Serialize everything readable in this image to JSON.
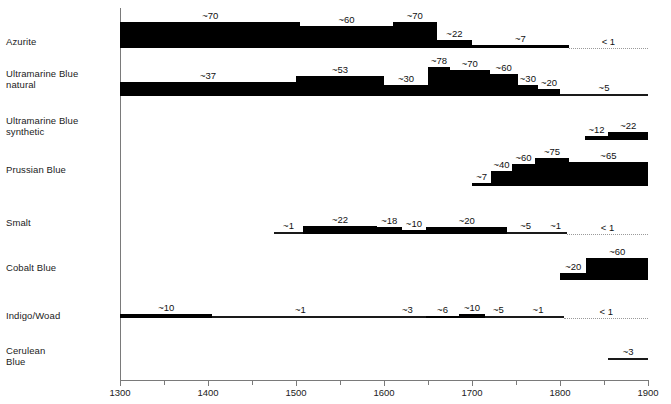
{
  "chart_data": {
    "type": "bar",
    "title": "",
    "xlabel": "",
    "ylabel": "",
    "xlim": [
      1300,
      1900
    ],
    "x_ticks": [
      1300,
      1350,
      1400,
      1450,
      1500,
      1550,
      1600,
      1650,
      1700,
      1750,
      1800,
      1850,
      1900
    ],
    "x_tick_labels": [
      "1300",
      "",
      "1400",
      "",
      "1500",
      "",
      "1600",
      "",
      "1700",
      "",
      "1800",
      "",
      "1900"
    ],
    "grid": false,
    "legend": "none",
    "value_prefix": "~",
    "note": "Horizontal timeline chart: relative usage/frequency of blue pigments over time. Each pigment row is a stepped band whose thickness encodes the value printed above each step.",
    "categories": [
      "Azurite",
      "Ultramarine Blue natural",
      "Ultramarine Blue synthetic",
      "Prussian Blue",
      "Smalt",
      "Cobalt Blue",
      "Indigo/Woad",
      "Cerulean Blue"
    ],
    "series": [
      {
        "name": "Azurite",
        "label_lines": [
          "Azurite"
        ],
        "segments": [
          {
            "start": 1300,
            "end": 1505,
            "value": 70,
            "label": "~70"
          },
          {
            "start": 1505,
            "end": 1610,
            "value": 60,
            "label": "~60"
          },
          {
            "start": 1610,
            "end": 1660,
            "value": 70,
            "label": "~70"
          },
          {
            "start": 1660,
            "end": 1700,
            "value": 22,
            "label": "~22"
          },
          {
            "start": 1700,
            "end": 1810,
            "value": 7,
            "label": "~7"
          },
          {
            "start": 1810,
            "end": 1900,
            "value": 0.5,
            "label": "< 1",
            "style": "dotted"
          }
        ]
      },
      {
        "name": "Ultramarine Blue natural",
        "label_lines": [
          "Ultramarine Blue",
          "natural"
        ],
        "segments": [
          {
            "start": 1300,
            "end": 1500,
            "value": 37,
            "label": "~37"
          },
          {
            "start": 1500,
            "end": 1600,
            "value": 53,
            "label": "~53"
          },
          {
            "start": 1600,
            "end": 1650,
            "value": 30,
            "label": "~30"
          },
          {
            "start": 1650,
            "end": 1675,
            "value": 78,
            "label": "~78"
          },
          {
            "start": 1675,
            "end": 1720,
            "value": 70,
            "label": "~70"
          },
          {
            "start": 1720,
            "end": 1752,
            "value": 60,
            "label": "~60"
          },
          {
            "start": 1752,
            "end": 1775,
            "value": 30,
            "label": "~30"
          },
          {
            "start": 1775,
            "end": 1800,
            "value": 20,
            "label": "~20"
          },
          {
            "start": 1800,
            "end": 1900,
            "value": 5,
            "label": "~5"
          }
        ]
      },
      {
        "name": "Ultramarine Blue synthetic",
        "label_lines": [
          "Ultramarine Blue",
          "synthetic"
        ],
        "segments": [
          {
            "start": 1828,
            "end": 1855,
            "value": 12,
            "label": "~12"
          },
          {
            "start": 1855,
            "end": 1900,
            "value": 22,
            "label": "~22"
          }
        ]
      },
      {
        "name": "Prussian Blue",
        "label_lines": [
          "Prussian Blue"
        ],
        "segments": [
          {
            "start": 1700,
            "end": 1722,
            "value": 7,
            "label": "~7"
          },
          {
            "start": 1722,
            "end": 1745,
            "value": 40,
            "label": "~40"
          },
          {
            "start": 1745,
            "end": 1772,
            "value": 60,
            "label": "~60"
          },
          {
            "start": 1772,
            "end": 1810,
            "value": 75,
            "label": "~75"
          },
          {
            "start": 1810,
            "end": 1900,
            "value": 65,
            "label": "~65"
          }
        ]
      },
      {
        "name": "Smalt",
        "label_lines": [
          "Smalt"
        ],
        "segments": [
          {
            "start": 1475,
            "end": 1508,
            "value": 1,
            "label": "~1"
          },
          {
            "start": 1508,
            "end": 1592,
            "value": 22,
            "label": "~22"
          },
          {
            "start": 1592,
            "end": 1620,
            "value": 18,
            "label": "~18"
          },
          {
            "start": 1620,
            "end": 1648,
            "value": 10,
            "label": "~10"
          },
          {
            "start": 1648,
            "end": 1740,
            "value": 20,
            "label": "~20"
          },
          {
            "start": 1740,
            "end": 1782,
            "value": 5,
            "label": "~5"
          },
          {
            "start": 1782,
            "end": 1808,
            "value": 1,
            "label": "~1"
          },
          {
            "start": 1808,
            "end": 1900,
            "value": 0.5,
            "label": "< 1",
            "style": "dotted"
          }
        ]
      },
      {
        "name": "Cobalt Blue",
        "label_lines": [
          "Cobalt Blue"
        ],
        "segments": [
          {
            "start": 1800,
            "end": 1830,
            "value": 20,
            "label": "~20"
          },
          {
            "start": 1830,
            "end": 1900,
            "value": 60,
            "label": "~60"
          }
        ]
      },
      {
        "name": "Indigo/Woad",
        "label_lines": [
          "Indigo/Woad"
        ],
        "segments": [
          {
            "start": 1300,
            "end": 1405,
            "value": 10,
            "label": "~10"
          },
          {
            "start": 1405,
            "end": 1605,
            "value": 1,
            "label": "~1"
          },
          {
            "start": 1605,
            "end": 1648,
            "value": 3,
            "label": "~3"
          },
          {
            "start": 1648,
            "end": 1685,
            "value": 6,
            "label": "~6"
          },
          {
            "start": 1685,
            "end": 1715,
            "value": 10,
            "label": "~10"
          },
          {
            "start": 1715,
            "end": 1745,
            "value": 5,
            "label": "~5"
          },
          {
            "start": 1745,
            "end": 1805,
            "value": 1,
            "label": "~1"
          },
          {
            "start": 1805,
            "end": 1900,
            "value": 0.5,
            "label": "< 1",
            "style": "dotted"
          }
        ]
      },
      {
        "name": "Cerulean Blue",
        "label_lines": [
          "Cerulean",
          "Blue"
        ],
        "segments": [
          {
            "start": 1855,
            "end": 1900,
            "value": 3,
            "label": "~3"
          }
        ]
      }
    ]
  }
}
